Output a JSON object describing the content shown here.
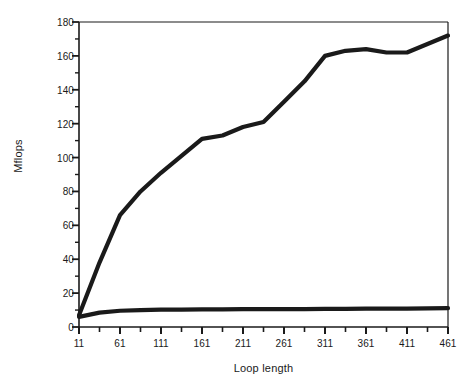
{
  "chart_data": {
    "type": "line",
    "title": "",
    "xlabel": "Loop length",
    "ylabel": "Mflops",
    "xlim": [
      11,
      461
    ],
    "ylim": [
      0,
      180
    ],
    "grid": false,
    "legend": "none",
    "y_ticks": [
      0,
      20,
      40,
      60,
      80,
      100,
      120,
      140,
      160,
      180
    ],
    "y_minor_step": 10,
    "x_ticks": [
      11,
      61,
      111,
      161,
      211,
      261,
      311,
      361,
      411,
      461
    ],
    "x_minor_ticks": [
      36,
      86,
      136,
      186,
      236,
      286,
      336,
      386,
      436
    ],
    "x": [
      11,
      36,
      61,
      86,
      111,
      136,
      161,
      186,
      211,
      236,
      261,
      286,
      311,
      336,
      361,
      386,
      411,
      436,
      461
    ],
    "series": [
      {
        "name": "upper-curve",
        "color": "#1a1a1a",
        "values": [
          7,
          38,
          66,
          80,
          91,
          101,
          111,
          113,
          118,
          121,
          133,
          145,
          160,
          163,
          164,
          162,
          162,
          167,
          172
        ]
      },
      {
        "name": "lower-curve",
        "color": "#1a1a1a",
        "values": [
          6,
          8.5,
          9.6,
          10.0,
          10.2,
          10.3,
          10.4,
          10.4,
          10.5,
          10.5,
          10.6,
          10.6,
          10.7,
          10.7,
          10.8,
          10.8,
          10.9,
          11.0,
          11.1
        ]
      }
    ]
  }
}
